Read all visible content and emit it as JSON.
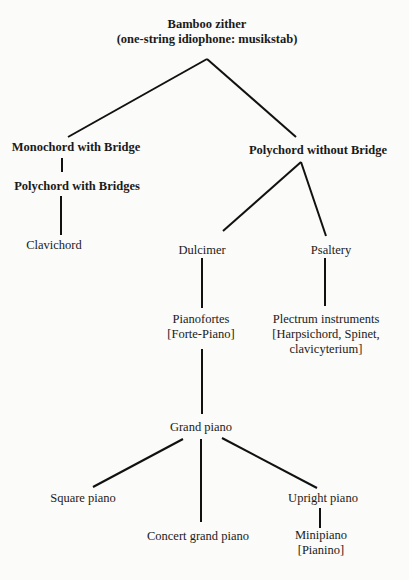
{
  "diagram": {
    "type": "family-tree",
    "title": "Bamboo zither",
    "nodes": {
      "root": {
        "line1": "Bamboo zither",
        "line2": "(one-string idiophone: musikstab)"
      },
      "monochord": {
        "line1": "Monochord with Bridge"
      },
      "polychord_bridges": {
        "line1": "Polychord with Bridges"
      },
      "clavichord": {
        "line1": "Clavichord"
      },
      "polychord_without": {
        "line1": "Polychord without Bridge"
      },
      "dulcimer": {
        "line1": "Dulcimer"
      },
      "psaltery": {
        "line1": "Psaltery"
      },
      "pianofortes": {
        "line1": "Pianofortes",
        "line2": "[Forte-Piano]"
      },
      "plectrum": {
        "line1": "Plectrum instruments",
        "line2": "[Harpsichord, Spinet,",
        "line3": "clavicyterium]"
      },
      "grand_piano": {
        "line1": "Grand piano"
      },
      "square_piano": {
        "line1": "Square piano"
      },
      "concert_grand": {
        "line1": "Concert grand piano"
      },
      "upright_piano": {
        "line1": "Upright piano"
      },
      "minipiano": {
        "line1": "Minipiano",
        "line2": "[Pianino]"
      }
    },
    "edges": [
      [
        "root",
        "monochord"
      ],
      [
        "root",
        "polychord_without"
      ],
      [
        "monochord",
        "polychord_bridges"
      ],
      [
        "polychord_bridges",
        "clavichord"
      ],
      [
        "polychord_without",
        "dulcimer"
      ],
      [
        "polychord_without",
        "psaltery"
      ],
      [
        "dulcimer",
        "pianofortes"
      ],
      [
        "psaltery",
        "plectrum"
      ],
      [
        "pianofortes",
        "grand_piano"
      ],
      [
        "grand_piano",
        "square_piano"
      ],
      [
        "grand_piano",
        "concert_grand"
      ],
      [
        "grand_piano",
        "upright_piano"
      ],
      [
        "upright_piano",
        "minipiano"
      ]
    ]
  }
}
